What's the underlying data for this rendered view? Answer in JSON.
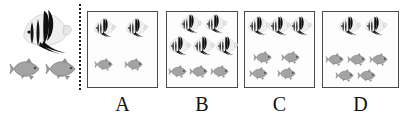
{
  "figure": {
    "type": "multiple-choice-picture-problem",
    "fish_kinds": {
      "angelfish": {
        "name": "black-angelfish",
        "color": "#111111"
      },
      "catfish": {
        "name": "gray-fish",
        "color": "#9a9a9a"
      }
    }
  },
  "reference": {
    "name": "reference-group",
    "angelfish_count": 1,
    "grayfish_count": 2
  },
  "divider": {
    "name": "dotted-divider",
    "style": "dotted",
    "color": "#1a1a1a"
  },
  "options": [
    {
      "id": "A",
      "label": "A",
      "angelfish_count": 2,
      "grayfish_count": 2,
      "angelfish_positions": [
        {
          "x": 4,
          "y": 6
        },
        {
          "x": 36,
          "y": 6
        }
      ],
      "grayfish_positions": [
        {
          "x": 8,
          "y": 47
        },
        {
          "x": 38,
          "y": 47
        }
      ]
    },
    {
      "id": "B",
      "label": "B",
      "angelfish_count": 5,
      "grayfish_count": 3,
      "angelfish_positions": [
        {
          "x": 11,
          "y": 2
        },
        {
          "x": 36,
          "y": 2
        },
        {
          "x": 0,
          "y": 24
        },
        {
          "x": 24,
          "y": 24
        },
        {
          "x": 47,
          "y": 24
        }
      ],
      "grayfish_positions": [
        {
          "x": 3,
          "y": 54
        },
        {
          "x": 24,
          "y": 54
        },
        {
          "x": 45,
          "y": 54
        }
      ]
    },
    {
      "id": "C",
      "label": "C",
      "angelfish_count": 3,
      "grayfish_count": 4,
      "angelfish_positions": [
        {
          "x": 1,
          "y": 4
        },
        {
          "x": 22,
          "y": 4
        },
        {
          "x": 43,
          "y": 4
        }
      ],
      "grayfish_positions": [
        {
          "x": 10,
          "y": 40
        },
        {
          "x": 38,
          "y": 40
        },
        {
          "x": 6,
          "y": 56
        },
        {
          "x": 34,
          "y": 56
        }
      ]
    },
    {
      "id": "D",
      "label": "D",
      "angelfish_count": 2,
      "grayfish_count": 5,
      "angelfish_positions": [
        {
          "x": 14,
          "y": 4
        },
        {
          "x": 40,
          "y": 4
        }
      ],
      "grayfish_positions": [
        {
          "x": 4,
          "y": 42
        },
        {
          "x": 26,
          "y": 42
        },
        {
          "x": 48,
          "y": 42
        },
        {
          "x": 14,
          "y": 58
        },
        {
          "x": 36,
          "y": 58
        }
      ]
    }
  ]
}
